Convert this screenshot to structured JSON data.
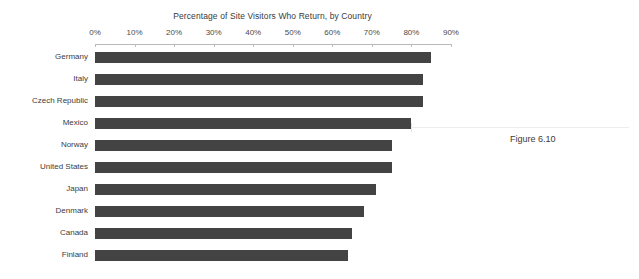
{
  "figure": {
    "caption": "Figure 6.10"
  },
  "chart_data": {
    "type": "bar",
    "orientation": "horizontal",
    "title": "Percentage of Site Visitors Who Return, by Country",
    "xlabel": "",
    "ylabel": "",
    "xlim": [
      0,
      90
    ],
    "grid": false,
    "legend": null,
    "bar_color": "#434343",
    "axis_color": "#b9b9b9",
    "tick_labels": [
      "0%",
      "10%",
      "20%",
      "30%",
      "40%",
      "50%",
      "60%",
      "70%",
      "80%",
      "90%"
    ],
    "tick_values": [
      0,
      10,
      20,
      30,
      40,
      50,
      60,
      70,
      80,
      90
    ],
    "categories": [
      "Germany",
      "Italy",
      "Czech Republic",
      "Mexico",
      "Norway",
      "United States",
      "Japan",
      "Denmark",
      "Canada",
      "Finland"
    ],
    "values": [
      85,
      83,
      83,
      80,
      75,
      75,
      71,
      68,
      65,
      64
    ]
  }
}
